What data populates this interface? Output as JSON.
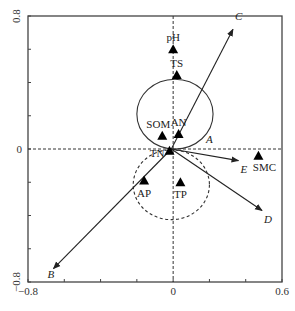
{
  "chart_data": {
    "type": "scatter",
    "subtype": "ordination-biplot",
    "title": "",
    "xlabel": "",
    "ylabel": "",
    "xlim": [
      -0.8,
      0.6
    ],
    "ylim": [
      -0.8,
      0.8
    ],
    "x_tick_labels": [
      {
        "value": -0.8,
        "label": "−0.8"
      },
      {
        "value": 0,
        "label": "0"
      },
      {
        "value": 0.6,
        "label": "0.6"
      }
    ],
    "y_tick_labels": [
      {
        "value": 0.8,
        "label": "0.8"
      },
      {
        "value": 0,
        "label": "0"
      },
      {
        "value": -0.8,
        "label": "−0.8"
      }
    ],
    "x_ticks": [
      -0.8,
      -0.6,
      -0.4,
      -0.2,
      0,
      0.2,
      0.4,
      0.6
    ],
    "y_ticks": [
      -0.8,
      -0.6,
      -0.4,
      -0.2,
      0,
      0.2,
      0.4,
      0.6,
      0.8
    ],
    "zero_lines": "dashed",
    "grid": false,
    "legend": "none",
    "points": [
      {
        "label": "pH",
        "x": 0.0,
        "y": 0.6,
        "marker": "triangle",
        "label_pos": "above"
      },
      {
        "label": "TS",
        "x": 0.02,
        "y": 0.445,
        "marker": "triangle",
        "label_pos": "above"
      },
      {
        "label": "SOM",
        "x": -0.06,
        "y": 0.08,
        "marker": "triangle",
        "label_pos": "above-left"
      },
      {
        "label": "AN",
        "x": 0.03,
        "y": 0.09,
        "marker": "triangle",
        "label_pos": "above"
      },
      {
        "label": "TN",
        "x": -0.02,
        "y": -0.01,
        "marker": "triangle",
        "label_pos": "left"
      },
      {
        "label": "AP",
        "x": -0.16,
        "y": -0.19,
        "marker": "triangle",
        "label_pos": "below"
      },
      {
        "label": "TP",
        "x": 0.04,
        "y": -0.2,
        "marker": "triangle",
        "label_pos": "below"
      },
      {
        "label": "SMC",
        "x": 0.47,
        "y": -0.04,
        "marker": "triangle",
        "label_pos": "below"
      }
    ],
    "arrows": [
      {
        "label": "A",
        "x": 0.17,
        "y": 0.02,
        "has_arrow": false
      },
      {
        "label": "B",
        "x": -0.66,
        "y": -0.72,
        "has_arrow": true
      },
      {
        "label": "C",
        "x": 0.33,
        "y": 0.72,
        "has_arrow": true
      },
      {
        "label": "D",
        "x": 0.49,
        "y": -0.37,
        "has_arrow": true
      },
      {
        "label": "E",
        "x": 0.36,
        "y": -0.07,
        "has_arrow": true
      }
    ],
    "arrow_origin": {
      "x": -0.01,
      "y": 0.0
    },
    "circles": [
      {
        "style": "solid",
        "cx": 0.01,
        "cy": 0.21,
        "r": 0.21
      },
      {
        "style": "dashed",
        "cx": -0.01,
        "cy": -0.215,
        "r": 0.21
      }
    ]
  },
  "colors": {
    "axis": "#444444",
    "marker": "#000000",
    "arrow": "#222222",
    "background": "#ffffff"
  }
}
